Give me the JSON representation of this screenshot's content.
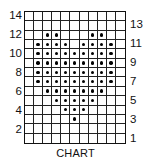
{
  "chart_data": {
    "type": "table",
    "title": "CHART",
    "columns": 11,
    "rows": 14,
    "row_labels_left": [
      "14",
      "12",
      "10",
      "8",
      "6",
      "4",
      "2"
    ],
    "row_labels_right": [
      "13",
      "11",
      "9",
      "7",
      "5",
      "3",
      "1"
    ],
    "dot_color": "#000000",
    "filled_cells_by_row": {
      "14": [],
      "13": [],
      "12": [
        3,
        4,
        8,
        9
      ],
      "11": [
        2,
        3,
        4,
        5,
        7,
        8,
        9,
        10
      ],
      "10": [
        2,
        3,
        4,
        5,
        6,
        7,
        8,
        9,
        10
      ],
      "9": [
        2,
        3,
        4,
        5,
        6,
        7,
        8,
        9,
        10
      ],
      "8": [
        2,
        3,
        4,
        5,
        6,
        7,
        8,
        9,
        10
      ],
      "7": [
        2,
        3,
        4,
        5,
        6,
        7,
        8,
        9,
        10
      ],
      "6": [
        3,
        4,
        5,
        6,
        7,
        8,
        9
      ],
      "5": [
        4,
        5,
        6,
        7,
        8
      ],
      "4": [
        5,
        6,
        7
      ],
      "3": [
        6
      ],
      "2": [],
      "1": []
    }
  },
  "caption": "CHART"
}
